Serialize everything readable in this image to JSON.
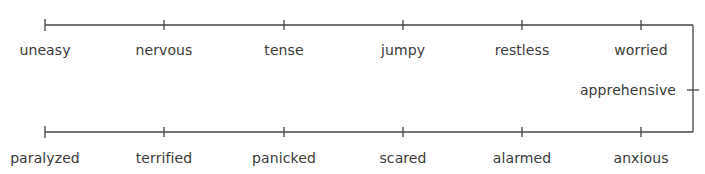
{
  "diagram": {
    "type": "word-continuum",
    "line_color": "#444444",
    "text_color": "#3a3a3a",
    "top_row": {
      "line_y": 25,
      "label_y": 42,
      "items": [
        {
          "label": "uneasy",
          "x": 45
        },
        {
          "label": "nervous",
          "x": 164
        },
        {
          "label": "tense",
          "x": 284
        },
        {
          "label": "jumpy",
          "x": 403
        },
        {
          "label": "restless",
          "x": 522
        },
        {
          "label": "worried",
          "x": 641
        }
      ]
    },
    "connector": {
      "x": 693,
      "top_y": 25,
      "bottom_y": 132,
      "item": {
        "label": "apprehensive",
        "y": 90
      }
    },
    "bottom_row": {
      "line_y": 132,
      "label_y": 150,
      "items": [
        {
          "label": "paralyzed",
          "x": 45
        },
        {
          "label": "terrified",
          "x": 164
        },
        {
          "label": "panicked",
          "x": 284
        },
        {
          "label": "scared",
          "x": 403
        },
        {
          "label": "alarmed",
          "x": 522
        },
        {
          "label": "anxious",
          "x": 641
        }
      ]
    }
  }
}
